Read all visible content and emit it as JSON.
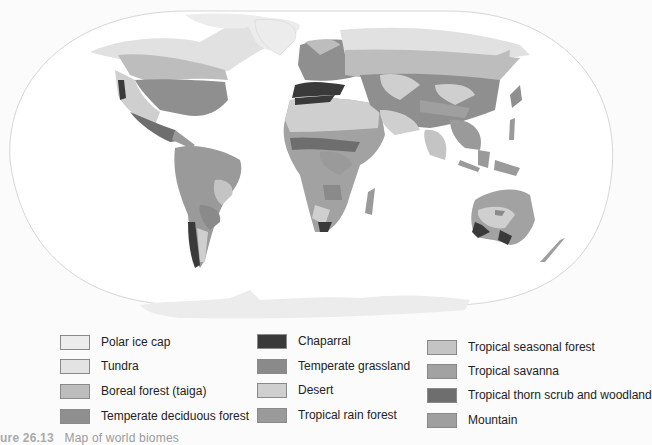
{
  "figure": {
    "caption_number": "ure 26.13",
    "caption_text": "Map of world biomes"
  },
  "colors": {
    "background": "#fbfbfb",
    "ocean": "#ffffff",
    "frame_outline": "#d4d4d4",
    "polar_ice_cap": "#ececec",
    "tundra": "#e1e1e1",
    "boreal_forest": "#bdbdbd",
    "temperate_deciduous_forest": "#8f8f8f",
    "chaparral": "#3a3a3a",
    "temperate_grassland": "#8a8a8a",
    "desert": "#cfcfcf",
    "tropical_rain_forest": "#9a9a9a",
    "tropical_seasonal_forest": "#c4c4c4",
    "tropical_savanna": "#a2a2a2",
    "tropical_thorn_scrub": "#6e6e6e",
    "mountain": "#9f9f9f"
  },
  "legend": {
    "columns": [
      {
        "items": [
          {
            "label": "Polar ice cap",
            "color": "#ececec"
          },
          {
            "label": "Tundra",
            "color": "#e3e3e3"
          },
          {
            "label": "Boreal forest (taiga)",
            "color": "#bdbdbd"
          },
          {
            "label": "Temperate deciduous forest",
            "color": "#8f8f8f"
          }
        ]
      },
      {
        "items": [
          {
            "label": "Chaparral",
            "color": "#3a3a3a"
          },
          {
            "label": "Temperate grassland",
            "color": "#8a8a8a"
          },
          {
            "label": "Desert",
            "color": "#cfcfcf"
          },
          {
            "label": "Tropical rain forest",
            "color": "#9a9a9a"
          }
        ]
      },
      {
        "items": [
          {
            "label": "Tropical seasonal forest",
            "color": "#c4c4c4"
          },
          {
            "label": "Tropical savanna",
            "color": "#a2a2a2"
          },
          {
            "label": "Tropical thorn scrub and woodland",
            "color": "#6e6e6e"
          },
          {
            "label": "Mountain",
            "color": "#9f9f9f"
          }
        ]
      }
    ]
  }
}
